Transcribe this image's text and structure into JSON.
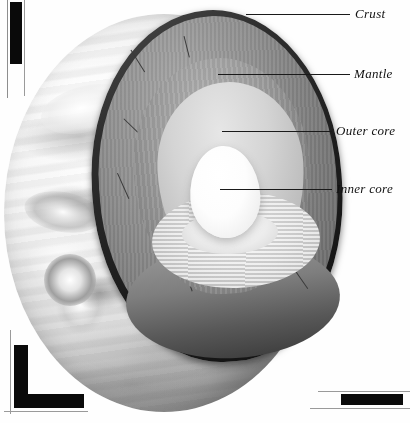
{
  "figure": {
    "style": "grayscale halftone illustration"
  },
  "labels": [
    {
      "id": "crust",
      "text": "Crust",
      "leader": "line-to-outer-rind"
    },
    {
      "id": "mantle",
      "text": "Mantle",
      "leader": "line-to-mantle-face"
    },
    {
      "id": "outer_core",
      "text": "Outer core",
      "leader": "line-to-outer-core"
    },
    {
      "id": "inner_core",
      "text": "Inner core",
      "leader": "line-to-inner-core"
    }
  ],
  "layers": [
    {
      "name": "Crust",
      "appearance": "thin dark rind",
      "color": "#1c1c1c"
    },
    {
      "name": "Mantle",
      "appearance": "thick medium-grey shell",
      "color": "#8f8f8f"
    },
    {
      "name": "Outer core",
      "appearance": "light grey shell",
      "color": "#d4d4d4"
    },
    {
      "name": "Inner core",
      "appearance": "bright white ovoid",
      "color": "#ffffff"
    }
  ],
  "surface": {
    "description": "banded swirling cloud texture with oval storms",
    "highlight_color": "#ffffff",
    "shadow_color": "#7a7a7a"
  },
  "registration_marks": [
    {
      "id": "top-left",
      "orientation": "vertical bar",
      "color": "#0a0a0a"
    },
    {
      "id": "bottom-left",
      "orientation": "L corner",
      "color": "#0a0a0a"
    },
    {
      "id": "bottom-right",
      "orientation": "horizontal bar",
      "color": "#0a0a0a"
    }
  ]
}
